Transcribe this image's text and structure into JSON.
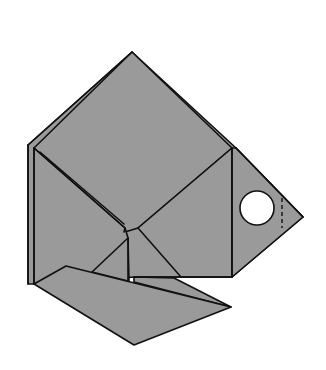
{
  "diagram": {
    "title": "Origami fish folding diagram",
    "subject": "fish",
    "colors": {
      "paper": "#9a9a9a",
      "outline": "#111111",
      "background": "#ffffff",
      "eye": "#ffffff"
    },
    "parts": [
      {
        "name": "body",
        "description": "square-ish main body rotated like a diamond"
      },
      {
        "name": "head",
        "description": "triangular head pointing right with eye"
      },
      {
        "name": "eye",
        "description": "white circle"
      },
      {
        "name": "fold-line",
        "description": "dashed valley fold near head tip"
      },
      {
        "name": "lower-fin",
        "description": "lower flap folded down"
      }
    ]
  }
}
